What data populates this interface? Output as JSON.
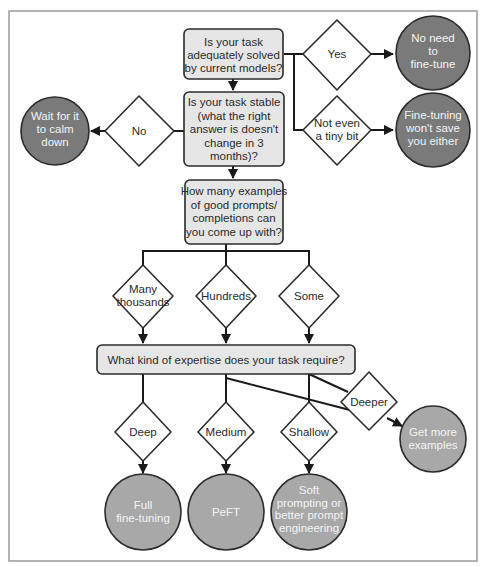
{
  "diagram": {
    "type": "flowchart",
    "colors": {
      "box_fill": "#e6e6e6",
      "diamond_fill": "#ffffff",
      "terminal_dark": "#7a7a7a",
      "terminal_light": "#a8a8a8",
      "stroke": "#2b2b2b"
    },
    "questions": {
      "q1": [
        "Is your task",
        "adequately solved",
        "by current models?"
      ],
      "q2": [
        "Is your task stable",
        "(what the right",
        "answer is doesn't",
        "change in 3",
        "months)?"
      ],
      "q3": [
        "How many examples",
        "of good prompts/",
        "completions can",
        "you come up with?"
      ],
      "q4": [
        "What kind of expertise does your task require?"
      ]
    },
    "decisions": {
      "yes": [
        "Yes"
      ],
      "not_even": [
        "Not even",
        "a tiny bit"
      ],
      "no": [
        "No"
      ],
      "many_thousands": [
        "Many",
        "thousands"
      ],
      "hundreds": [
        "Hundreds"
      ],
      "some": [
        "Some"
      ],
      "deep": [
        "Deep"
      ],
      "medium": [
        "Medium"
      ],
      "shallow": [
        "Shallow"
      ],
      "deeper": [
        "Deeper"
      ]
    },
    "outcomes": {
      "no_need": [
        "No need",
        "to",
        "fine-tune"
      ],
      "wont_save": [
        "Fine-tuning",
        "won't save",
        "you either"
      ],
      "wait": [
        "Wait for it",
        "to calm",
        "down"
      ],
      "get_more": [
        "Get more",
        "examples"
      ],
      "full": [
        "Full",
        "fine-tuning"
      ],
      "peft": [
        "PeFT"
      ],
      "soft": [
        "Soft",
        "prompting or",
        "better prompt",
        "engineering"
      ]
    }
  }
}
